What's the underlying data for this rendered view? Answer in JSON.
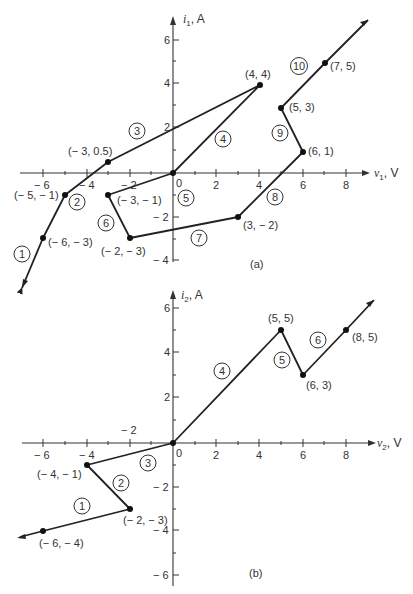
{
  "diagrams": [
    {
      "id": "a",
      "caption": "(a)",
      "x_axis": {
        "var": "v",
        "sub": "1",
        "unit": ", V",
        "ticks": [
          -6,
          -4,
          -2,
          2,
          4,
          6,
          8
        ],
        "tick_labels": [
          "− 6",
          "− 4",
          "− 2",
          "2",
          "4",
          "6",
          "8"
        ]
      },
      "y_axis": {
        "var": "i",
        "sub": "1",
        "unit": ", A",
        "ticks": [
          6,
          4,
          2,
          -2,
          -4
        ],
        "tick_labels": [
          "6",
          "4",
          "2",
          "− 2",
          "− 4"
        ]
      },
      "origin_label": "0",
      "points": [
        {
          "x": -6,
          "y": -3,
          "label": "(− 6, − 3)"
        },
        {
          "x": -5,
          "y": -1,
          "label": "(− 5, − 1)"
        },
        {
          "x": -3,
          "y": 0.5,
          "label": "(− 3, 0.5)"
        },
        {
          "x": 4,
          "y": 4,
          "label": "(4, 4)"
        },
        {
          "x": 0,
          "y": 0,
          "label": ""
        },
        {
          "x": -3,
          "y": -1,
          "label": "(− 3, − 1)"
        },
        {
          "x": -2,
          "y": -3,
          "label": "(− 2, − 3)"
        },
        {
          "x": 3,
          "y": -2,
          "label": "(3, − 2)"
        },
        {
          "x": 6,
          "y": 1,
          "label": "(6, 1)"
        },
        {
          "x": 5,
          "y": 3,
          "label": "(5, 3)"
        },
        {
          "x": 7,
          "y": 5,
          "label": "(7, 5)"
        }
      ],
      "segments": [
        "1",
        "2",
        "3",
        "4",
        "5",
        "6",
        "7",
        "8",
        "9",
        "10"
      ]
    },
    {
      "id": "b",
      "caption": "(b)",
      "x_axis": {
        "var": "v",
        "sub": "2",
        "unit": ", V",
        "ticks": [
          -6,
          -4,
          -2,
          2,
          4,
          6,
          8
        ],
        "tick_labels": [
          "− 6",
          "− 4",
          "− 2",
          "2",
          "4",
          "6",
          "8"
        ]
      },
      "y_axis": {
        "var": "i",
        "sub": "2",
        "unit": ", A",
        "ticks": [
          6,
          4,
          2,
          -2,
          -4,
          -6
        ],
        "tick_labels": [
          "6",
          "4",
          "2",
          "− 2",
          "− 4",
          "− 6"
        ]
      },
      "origin_label": "0",
      "points": [
        {
          "x": -6,
          "y": -4,
          "label": "(− 6, − 4)"
        },
        {
          "x": -2,
          "y": -3,
          "label": "(− 2, − 3)"
        },
        {
          "x": -4,
          "y": -1,
          "label": "(− 4, − 1)"
        },
        {
          "x": 0,
          "y": 0,
          "label": ""
        },
        {
          "x": 5,
          "y": 5,
          "label": "(5, 5)"
        },
        {
          "x": 6,
          "y": 3,
          "label": "(6, 3)"
        },
        {
          "x": 8,
          "y": 5,
          "label": "(8, 5)"
        }
      ],
      "segments": [
        "1",
        "2",
        "3",
        "4",
        "5",
        "6"
      ]
    }
  ]
}
